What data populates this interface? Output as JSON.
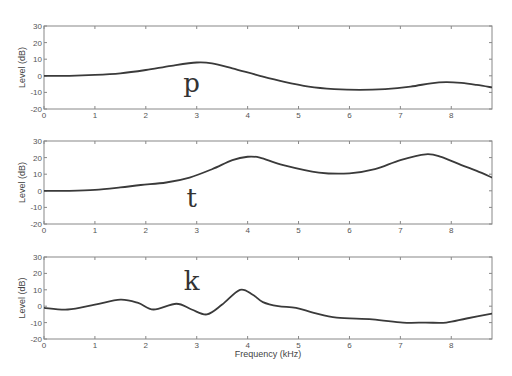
{
  "figure": {
    "xlabel": "Frequency (kHz)",
    "ylabel": "Level (dB)"
  },
  "chart_data": [
    {
      "type": "line",
      "title": "p",
      "xlabel": "",
      "ylabel": "Level (dB)",
      "xlim": [
        0,
        8.8
      ],
      "ylim": [
        -20,
        30
      ],
      "xticks": [
        0,
        1,
        2,
        3,
        4,
        5,
        6,
        7,
        8
      ],
      "yticks": [
        -20,
        -10,
        0,
        10,
        20,
        30
      ],
      "grid": false,
      "annotation": {
        "text": "p",
        "x": 2.9,
        "y": -10
      },
      "series": [
        {
          "name": "p",
          "x": [
            0,
            0.5,
            1.0,
            1.5,
            2.0,
            2.5,
            3.0,
            3.3,
            3.7,
            4.24,
            4.7,
            5.2,
            5.7,
            6.2,
            6.7,
            7.2,
            7.6,
            7.9,
            8.2,
            8.5,
            8.8
          ],
          "y": [
            0,
            0,
            0.5,
            1.5,
            3.5,
            6,
            8,
            7.5,
            4.5,
            0,
            -3.5,
            -6.5,
            -8,
            -8.5,
            -8,
            -6.5,
            -4.5,
            -3.8,
            -4.3,
            -5.5,
            -7
          ]
        }
      ]
    },
    {
      "type": "line",
      "title": "t",
      "xlabel": "",
      "ylabel": "Level (dB)",
      "xlim": [
        0,
        8.8
      ],
      "ylim": [
        -20,
        30
      ],
      "xticks": [
        0,
        1,
        2,
        3,
        4,
        5,
        6,
        7,
        8
      ],
      "yticks": [
        -20,
        -10,
        0,
        10,
        20,
        30
      ],
      "grid": false,
      "annotation": {
        "text": "t",
        "x": 2.9,
        "y": -10
      },
      "series": [
        {
          "name": "t",
          "x": [
            0,
            0.5,
            1.0,
            1.5,
            1.9,
            2.4,
            2.86,
            3.3,
            3.7,
            4.0,
            4.24,
            4.7,
            5.4,
            6.0,
            6.5,
            7.0,
            7.5,
            7.8,
            8.2,
            8.5,
            8.8
          ],
          "y": [
            0,
            0,
            0.5,
            2,
            3.5,
            5,
            8,
            13,
            18.5,
            20.5,
            20,
            15.5,
            11,
            10.5,
            13,
            18.5,
            22,
            20.5,
            15.5,
            12,
            8
          ]
        }
      ]
    },
    {
      "type": "line",
      "title": "k",
      "xlabel": "Frequency (kHz)",
      "ylabel": "Level (dB)",
      "xlim": [
        0,
        8.8
      ],
      "ylim": [
        -20,
        30
      ],
      "xticks": [
        0,
        1,
        2,
        3,
        4,
        5,
        6,
        7,
        8
      ],
      "yticks": [
        -20,
        -10,
        0,
        10,
        20,
        30
      ],
      "grid": false,
      "annotation": {
        "text": "k",
        "x": 2.9,
        "y": 10
      },
      "series": [
        {
          "name": "k",
          "x": [
            0,
            0.47,
            1.0,
            1.5,
            1.85,
            2.15,
            2.6,
            2.9,
            3.2,
            3.5,
            3.85,
            4.1,
            4.3,
            4.6,
            4.95,
            5.3,
            5.75,
            6.45,
            7.05,
            7.5,
            7.9,
            8.3,
            8.8
          ],
          "y": [
            -1,
            -2,
            1,
            4,
            2,
            -2,
            1.5,
            -2,
            -5,
            1,
            10,
            7,
            2.5,
            0,
            -1,
            -4,
            -7,
            -8,
            -10,
            -10,
            -10,
            -7.5,
            -4.5
          ]
        }
      ]
    }
  ],
  "layout": {
    "panels": [
      {
        "left": 44,
        "right": 492,
        "top": 26,
        "bottom": 109
      },
      {
        "left": 44,
        "right": 492,
        "top": 141,
        "bottom": 224
      },
      {
        "left": 44,
        "right": 492,
        "top": 257,
        "bottom": 339
      }
    ],
    "colors": {
      "line": "#3a3a3a",
      "axes": "#888888",
      "text": "#555555"
    }
  }
}
